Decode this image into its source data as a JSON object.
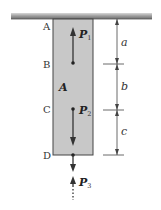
{
  "diagram": {
    "type": "axially loaded bar hanging from support",
    "colors": {
      "bar_fill": "#c8c8c8",
      "bar_stroke": "#444444",
      "ceiling": "#9a9a9a",
      "arrow": "#333333",
      "dimension": "#444444"
    },
    "points": [
      {
        "label": "A",
        "position": "top (support)"
      },
      {
        "label": "B",
        "position": "P1 application point"
      },
      {
        "label": "C",
        "position": "P2 application point"
      },
      {
        "label": "D",
        "position": "bottom end"
      }
    ],
    "area_label": "A",
    "forces": [
      {
        "name": "P",
        "subscript": "1",
        "direction": "up",
        "at": "B"
      },
      {
        "name": "P",
        "subscript": "2",
        "direction": "down",
        "at": "C"
      },
      {
        "name": "P",
        "subscript": "3",
        "direction": "down/up (unknown)",
        "at": "D"
      }
    ],
    "dimensions": [
      {
        "label": "a",
        "from": "A",
        "to": "B"
      },
      {
        "label": "b",
        "from": "B",
        "to": "C"
      },
      {
        "label": "c",
        "from": "C",
        "to": "D"
      }
    ]
  }
}
